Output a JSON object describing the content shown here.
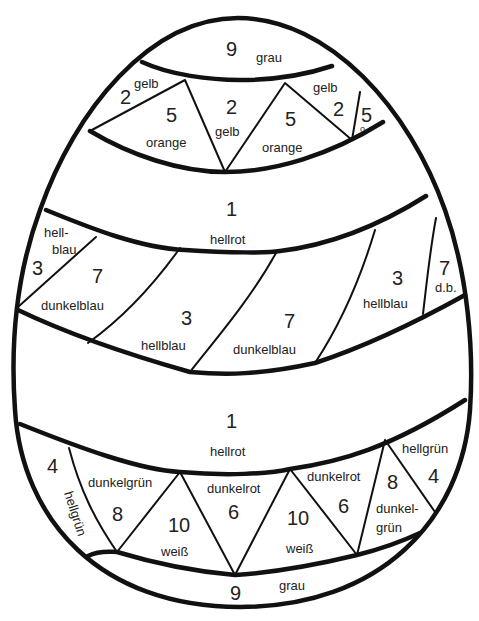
{
  "colors": {
    "1": "hellrot",
    "2": "gelb",
    "3": "hellblau",
    "4": "hellgrün",
    "5": "orange",
    "6": "dunkelrot",
    "7": "dunkelblau",
    "8": "dunkelgrün",
    "9": "grau",
    "10": "weiß"
  },
  "regions": {
    "top_cap": {
      "num": "9",
      "label": "grau"
    },
    "top_left_small": {
      "num": "2",
      "label": "gelb"
    },
    "top_left_tri": {
      "num": "5",
      "label": "orange"
    },
    "top_mid_tri": {
      "num": "2",
      "label": "gelb"
    },
    "top_right_tri": {
      "num": "5",
      "label": "orange"
    },
    "top_right_small": {
      "num": "2",
      "label": "gelb"
    },
    "top_far_right": {
      "num": "5",
      "label": "o."
    },
    "upper_red_band": {
      "num": "1",
      "label": "hellrot"
    },
    "blue_1": {
      "num": "3",
      "label_a": "hell-",
      "label_b": "blau"
    },
    "blue_2": {
      "num": "7",
      "label": "dunkelblau"
    },
    "blue_3": {
      "num": "3",
      "label": "hellblau"
    },
    "blue_4": {
      "num": "7",
      "label": "dunkelblau"
    },
    "blue_5": {
      "num": "3",
      "label": "hellblau"
    },
    "blue_6": {
      "num": "7",
      "label": "d.b."
    },
    "lower_red_band": {
      "num": "1",
      "label": "hellrot"
    },
    "bottom_left_strip": {
      "num": "4",
      "label": "hellgrün"
    },
    "bottom_tri_1": {
      "num": "8",
      "label": "dunkelgrün"
    },
    "bottom_tri_2": {
      "num": "10",
      "label": "weiß"
    },
    "bottom_tri_3": {
      "num": "6",
      "label": "dunkelrot"
    },
    "bottom_tri_4": {
      "num": "10",
      "label": "weiß"
    },
    "bottom_tri_5": {
      "num": "6",
      "label": "dunkelrot"
    },
    "bottom_tri_6": {
      "num": "8",
      "label_a": "dunkel-",
      "label_b": "grün"
    },
    "bottom_right_small": {
      "num": "4",
      "label": "hellgrün"
    },
    "bottom_cap": {
      "num": "9",
      "label": "grau"
    }
  }
}
